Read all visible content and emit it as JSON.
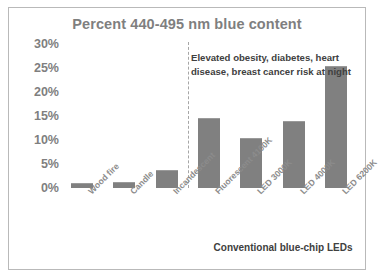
{
  "chart_data": {
    "type": "bar",
    "title": "Percent 440-495 nm blue content",
    "xlabel": "",
    "ylabel": "",
    "ylim": [
      0,
      30
    ],
    "grid": false,
    "legend": "none",
    "categories": [
      "Wood fire",
      "Candle",
      "Incandescent",
      "Fluorescent 4100K",
      "LED 3000K",
      "LED 4000K",
      "LED 6200K"
    ],
    "values": [
      1,
      1.2,
      3.8,
      14.5,
      10.5,
      14,
      25.5
    ],
    "ytick_labels": [
      "30%",
      "25%",
      "20%",
      "15%",
      "10%",
      "5%",
      "0%"
    ],
    "ytick_values": [
      30,
      25,
      20,
      15,
      10,
      5,
      0
    ],
    "bar_color": "#808080",
    "title_color": "#7f7f7f",
    "annotations": [
      {
        "name": "risk-annotation",
        "text": "Elevated obesity, diabetes, heart disease, breast cancer risk at night"
      },
      {
        "name": "led-group-caption",
        "text": "Conventional blue-chip LEDs"
      }
    ],
    "divider": {
      "name": "category-divider",
      "style": "dashed",
      "after_category": "Incandescent",
      "color": "#a6a6a6"
    }
  }
}
